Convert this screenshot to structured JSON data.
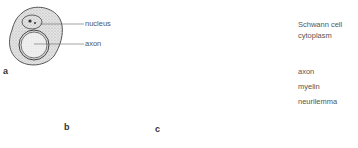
{
  "figure": {
    "panels": [
      {
        "id": "a",
        "label": "a",
        "labels": [
          {
            "text": "nucleus"
          },
          {
            "text": "axon"
          }
        ]
      },
      {
        "id": "b",
        "label": "b"
      },
      {
        "id": "c",
        "label": "c",
        "labels": [
          {
            "text": "Schwann cell"
          },
          {
            "text": "cytoplasm"
          },
          {
            "text": "axon"
          },
          {
            "text": "myelin"
          },
          {
            "text": "neurilemma"
          }
        ]
      }
    ],
    "colors": {
      "stipple": "#d8d8d8",
      "outline": "#555555",
      "label_text": "#555555",
      "leader_line": "#666666"
    }
  }
}
